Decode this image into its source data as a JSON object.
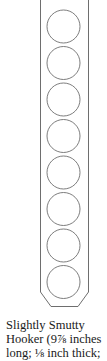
{
  "figure": {
    "hole_count": 8,
    "stroke_color": "#6e6e6e",
    "background": "#ffffff"
  },
  "caption": {
    "lines": [
      "Slightly Smutty",
      "Hooker (9⅞ inches",
      "long; ⅛ inch thick;"
    ]
  }
}
